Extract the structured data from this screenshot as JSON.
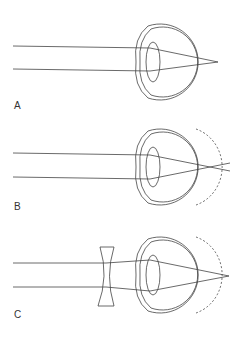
{
  "figure": {
    "panels": [
      {
        "label": "A",
        "condition": "normal eye",
        "focus": "on retina"
      },
      {
        "label": "B",
        "condition": "myopic (elongated) eye",
        "focus": "in front of retina"
      },
      {
        "label": "C",
        "condition": "myopic eye corrected with concave lens",
        "focus": "on retina"
      }
    ]
  },
  "colors": {
    "line": "#444444",
    "background": "#ffffff"
  }
}
